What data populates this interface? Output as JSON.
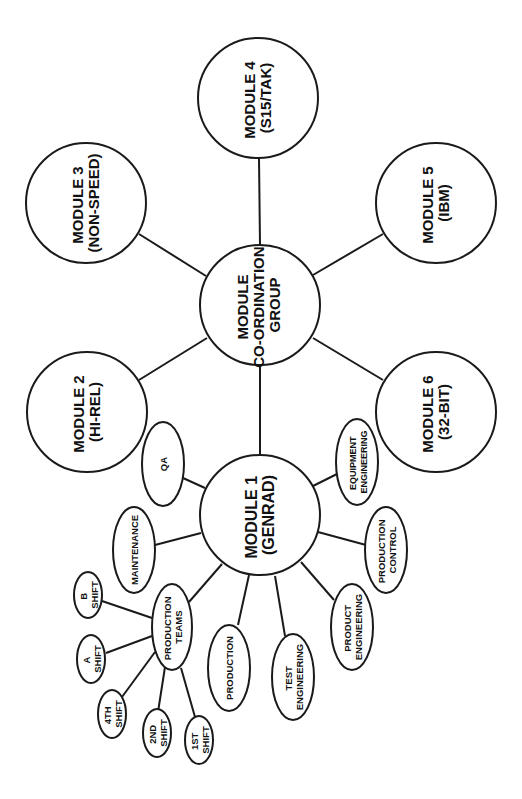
{
  "diagram": {
    "orientation": "rotated -90deg (text reads bottom-to-top)",
    "colors": {
      "stroke": "#1a1a1a",
      "fill": "#ffffff",
      "text": "#111111"
    },
    "hub": {
      "id": "coord",
      "lines": [
        "MODULE",
        "CO-ORDINATION",
        "GROUP"
      ]
    },
    "modules": [
      {
        "id": "m1",
        "lines": [
          "MODULE 1",
          "(GENRAD)"
        ]
      },
      {
        "id": "m2",
        "lines": [
          "MODULE 2",
          "(HI-REL)"
        ]
      },
      {
        "id": "m3",
        "lines": [
          "MODULE 3",
          "(NON-SPEED)"
        ]
      },
      {
        "id": "m4",
        "lines": [
          "MODULE 4",
          "(S15/TAK)"
        ]
      },
      {
        "id": "m5",
        "lines": [
          "MODULE 5",
          "(IBM)"
        ]
      },
      {
        "id": "m6",
        "lines": [
          "MODULE 6",
          "(32-BIT)"
        ]
      }
    ],
    "module1_functions": [
      {
        "id": "qa",
        "lines": [
          "QA"
        ]
      },
      {
        "id": "maint",
        "lines": [
          "MAINTENANCE"
        ]
      },
      {
        "id": "pteams",
        "lines": [
          "PRODUCTION",
          "TEAMS"
        ]
      },
      {
        "id": "prod",
        "lines": [
          "PRODUCTION"
        ]
      },
      {
        "id": "testeng",
        "lines": [
          "TEST",
          "ENGINEERING"
        ]
      },
      {
        "id": "prodeng",
        "lines": [
          "PRODUCT",
          "ENGINEERING"
        ]
      },
      {
        "id": "prodctl",
        "lines": [
          "PRODUCTION",
          "CONTROL"
        ]
      },
      {
        "id": "equipeng",
        "lines": [
          "EQUIPMENT",
          "ENGINEERING"
        ]
      }
    ],
    "production_team_shifts": [
      {
        "id": "bshift",
        "lines": [
          "B",
          "SHIFT"
        ]
      },
      {
        "id": "ashift",
        "lines": [
          "A",
          "SHIFT"
        ]
      },
      {
        "id": "s4",
        "lines": [
          "4TH",
          "SHIFT"
        ]
      },
      {
        "id": "s2",
        "lines": [
          "2ND",
          "SHIFT"
        ]
      },
      {
        "id": "s1",
        "lines": [
          "1ST",
          "SHIFT"
        ]
      }
    ],
    "edges": [
      [
        "coord",
        "m1"
      ],
      [
        "coord",
        "m2"
      ],
      [
        "coord",
        "m3"
      ],
      [
        "coord",
        "m4"
      ],
      [
        "coord",
        "m5"
      ],
      [
        "coord",
        "m6"
      ],
      [
        "m1",
        "qa"
      ],
      [
        "m1",
        "maint"
      ],
      [
        "m1",
        "pteams"
      ],
      [
        "m1",
        "prod"
      ],
      [
        "m1",
        "testeng"
      ],
      [
        "m1",
        "prodeng"
      ],
      [
        "m1",
        "prodctl"
      ],
      [
        "m1",
        "equipeng"
      ],
      [
        "pteams",
        "bshift"
      ],
      [
        "pteams",
        "ashift"
      ],
      [
        "pteams",
        "s4"
      ],
      [
        "pteams",
        "s2"
      ],
      [
        "pteams",
        "s1"
      ]
    ]
  }
}
